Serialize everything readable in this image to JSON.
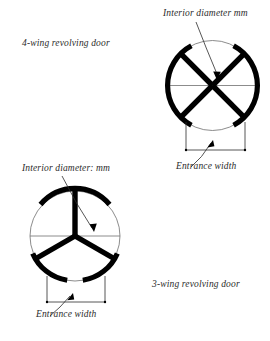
{
  "diagram": {
    "title_semantic": "revolving-door-plan-diagrams",
    "labels": {
      "four_wing": "4-wing revolving door",
      "three_wing": "3-wing revolving door",
      "interior_diameter_top": "Interior diameter mm",
      "interior_diameter_bottom": "Interior diameter: mm",
      "entrance_width_top": "Entrance width",
      "entrance_width_bottom": "Entrance width"
    },
    "colors": {
      "background": "#ffffff",
      "vane_stroke": "#000000",
      "thin_line": "#6e6e6e",
      "text": "#2b2b2b"
    },
    "four_wing": {
      "center_x": 212.5,
      "center_y": 85.5,
      "radius": 45,
      "vane_count": 4,
      "vane_angles_deg": [
        45,
        135,
        225,
        315
      ],
      "enclosure_arcs_deg": [
        [
          118,
          242
        ],
        [
          298,
          62
        ]
      ],
      "entrance_width_span_px": 60
    },
    "three_wing": {
      "center_x": 75,
      "center_y": 236,
      "radius": 45,
      "vane_count": 3,
      "vane_angles_deg": [
        90,
        210,
        330
      ],
      "enclosure_arcs_deg": [
        [
          100,
          200
        ],
        [
          220,
          320
        ],
        [
          340,
          80
        ]
      ],
      "entrance_width_span_px": 58
    }
  }
}
